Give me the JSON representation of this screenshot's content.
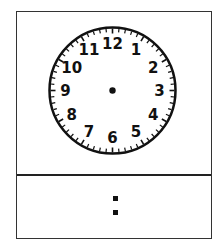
{
  "clock": {
    "numerals": [
      "12",
      "1",
      "2",
      "3",
      "4",
      "5",
      "6",
      "7",
      "8",
      "9",
      "10",
      "11"
    ],
    "center": {
      "x": 113,
      "y": 91
    },
    "radius": 63,
    "minute_ticks": 60,
    "hands": "none"
  },
  "digital_display": {
    "hours": "",
    "separator": ":",
    "minutes": ""
  },
  "colors": {
    "stroke": "#111111",
    "background": "#ffffff"
  }
}
